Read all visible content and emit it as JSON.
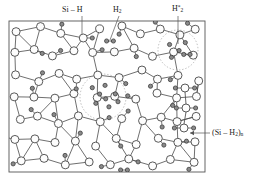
{
  "figure": {
    "frame": {
      "x": 9,
      "y": 21,
      "width": 196,
      "height": 151
    },
    "colors": {
      "background": "#ffffff",
      "frame_stroke": "#555555",
      "bond_stroke": "#4a4a4a",
      "silicon_fill": "#fdfdfd",
      "silicon_stroke": "#3b3b3b",
      "hydrogen_fill": "#8a8a8a",
      "hydrogen_stroke": "#2e2e2e",
      "void_dash": "#9a9a9a",
      "label_text": "#1a1a1a",
      "leader_line": "#555555"
    }
  },
  "labels": [
    {
      "name": "si-h-label",
      "html": "Si – H",
      "text_x": 62,
      "text_y": 6,
      "leader": {
        "x1": 82,
        "y1": 16,
        "x2": 82,
        "y2": 34
      }
    },
    {
      "name": "h2-label",
      "html": "H<sub>2</sub>",
      "text_x": 113,
      "text_y": 6,
      "leader": {
        "x1": 119,
        "y1": 16,
        "x2": 110,
        "y2": 40
      }
    },
    {
      "name": "h2-star-label",
      "html": "H<sup>*</sup><sub>2</sub>",
      "text_x": 172,
      "text_y": 5,
      "leader": {
        "x1": 178,
        "y1": 16,
        "x2": 178,
        "y2": 44
      }
    },
    {
      "name": "polysilane-label",
      "html": "(Si – H<sub>2</sub>)<sub>n</sub>",
      "text_x": 212,
      "text_y": 129,
      "leader": {
        "x1": 210,
        "y1": 133,
        "x2": 190,
        "y2": 133
      },
      "arrow": true
    }
  ],
  "legend_semantics": {
    "large_open_circle": "silicon atom",
    "small_filled_circle": "hydrogen atom",
    "solid_line": "covalent bond",
    "dashed_circle": "microvoid / internal surface"
  },
  "chart_data": {
    "type": "diagram",
    "silicon_atoms": [
      [
        18,
        30
      ],
      [
        40,
        27
      ],
      [
        60,
        34
      ],
      [
        82,
        40
      ],
      [
        101,
        29
      ],
      [
        120,
        27
      ],
      [
        142,
        33
      ],
      [
        160,
        28
      ],
      [
        181,
        34
      ],
      [
        196,
        30
      ],
      [
        13,
        52
      ],
      [
        33,
        48
      ],
      [
        52,
        57
      ],
      [
        73,
        52
      ],
      [
        93,
        52
      ],
      [
        113,
        50
      ],
      [
        133,
        48
      ],
      [
        152,
        56
      ],
      [
        172,
        52
      ],
      [
        194,
        57
      ],
      [
        17,
        74
      ],
      [
        37,
        80
      ],
      [
        57,
        72
      ],
      [
        78,
        78
      ],
      [
        99,
        74
      ],
      [
        119,
        76
      ],
      [
        140,
        72
      ],
      [
        158,
        80
      ],
      [
        178,
        74
      ],
      [
        197,
        80
      ],
      [
        14,
        97
      ],
      [
        34,
        95
      ],
      [
        55,
        99
      ],
      [
        75,
        94
      ],
      [
        96,
        99
      ],
      [
        116,
        96
      ],
      [
        136,
        100
      ],
      [
        156,
        95
      ],
      [
        176,
        99
      ],
      [
        196,
        96
      ],
      [
        19,
        118
      ],
      [
        39,
        116
      ],
      [
        59,
        122
      ],
      [
        80,
        118
      ],
      [
        100,
        122
      ],
      [
        120,
        118
      ],
      [
        141,
        121
      ],
      [
        161,
        117
      ],
      [
        178,
        121
      ],
      [
        197,
        118
      ],
      [
        15,
        141
      ],
      [
        35,
        139
      ],
      [
        56,
        143
      ],
      [
        77,
        139
      ],
      [
        97,
        144
      ],
      [
        118,
        140
      ],
      [
        138,
        143
      ],
      [
        158,
        139
      ],
      [
        176,
        143
      ],
      [
        196,
        140
      ],
      [
        22,
        163
      ],
      [
        45,
        160
      ],
      [
        66,
        165
      ],
      [
        88,
        161
      ],
      [
        109,
        165
      ],
      [
        130,
        161
      ],
      [
        151,
        164
      ],
      [
        172,
        161
      ],
      [
        192,
        164
      ]
    ],
    "hydrogen_atoms": 54,
    "h2_molecules": 2,
    "microvoids": 2,
    "polysilane_chain_units": 3
  }
}
